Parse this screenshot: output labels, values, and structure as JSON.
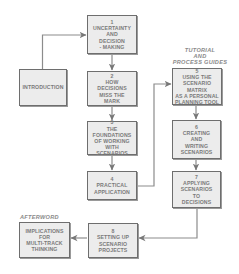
{
  "diagram": {
    "headings": {
      "tutorial": "TUTORIAL\nAND\nPROCESS GUIDES",
      "afterword": "AFTERWORD"
    },
    "nodes": {
      "introduction": {
        "number": "",
        "label": "INTRODUCTION"
      },
      "n1": {
        "number": "1",
        "label": "UNCERTAINTY\nAND\nDECISION\n- MAKING"
      },
      "n2": {
        "number": "2",
        "label": "HOW\nDECISIONS\nMISS THE\nMARK"
      },
      "n3": {
        "number": "3",
        "label": "THE\nFOUNDATIONS\nOF WORKING\nWITH SCENARIOS"
      },
      "n4": {
        "number": "4",
        "label": "PRACTICAL\nAPPLICATION"
      },
      "n5": {
        "number": "5",
        "label": "USING THE\nSCENARIO MATRIX\nAS A PERSONAL\nPLANNING TOOL"
      },
      "n6": {
        "number": "6",
        "label": "CREATING\nAND\nWRITING\nSCENARIOS"
      },
      "n7": {
        "number": "7",
        "label": "APPLYING\nSCENARIOS\nTO\nDECISIONS"
      },
      "n8": {
        "number": "8",
        "label": "SETTING UP\nSCENARIO\nPROJECTS"
      },
      "implications": {
        "number": "",
        "label": "IMPLICATIONS\nFOR\nMULTI-TRACK\nTHINKING"
      }
    },
    "edges": [
      {
        "from": "introduction",
        "to": "n1"
      },
      {
        "from": "n1",
        "to": "n2"
      },
      {
        "from": "n2",
        "to": "n3"
      },
      {
        "from": "n3",
        "to": "n4"
      },
      {
        "from": "n4",
        "to": "n5"
      },
      {
        "from": "n5",
        "to": "n6"
      },
      {
        "from": "n6",
        "to": "n7"
      },
      {
        "from": "n7",
        "to": "n8"
      },
      {
        "from": "n8",
        "to": "implications"
      }
    ],
    "colors": {
      "box_fill": "#ececec",
      "box_border": "#6e6e6e",
      "text": "#7a7a7a",
      "line": "#8c8c8c"
    }
  }
}
